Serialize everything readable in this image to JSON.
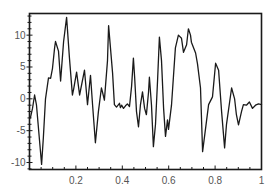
{
  "chart_data": {
    "type": "line",
    "title": "",
    "xlabel": "",
    "ylabel": "",
    "xlim": [
      0,
      1
    ],
    "ylim": [
      -11.1,
      13.4
    ],
    "grid": false,
    "legend": null,
    "x_ticks": [
      0.2,
      0.4,
      0.6,
      0.8,
      1
    ],
    "x_tick_labels": [
      "0.2",
      "0.4",
      "0.6",
      "0.8",
      "1"
    ],
    "y_ticks": [
      -10,
      -5,
      0,
      5,
      10
    ],
    "y_tick_labels": [
      "-10",
      "-5",
      "0",
      "5",
      "10"
    ],
    "line_color": "#1a1a1a",
    "series": [
      {
        "name": "signal",
        "x": [
          0.004,
          0.013,
          0.022,
          0.03,
          0.043,
          0.052,
          0.06,
          0.069,
          0.082,
          0.091,
          0.099,
          0.108,
          0.112,
          0.125,
          0.134,
          0.147,
          0.16,
          0.172,
          0.185,
          0.19,
          0.203,
          0.216,
          0.237,
          0.25,
          0.263,
          0.272,
          0.284,
          0.297,
          0.31,
          0.315,
          0.323,
          0.336,
          0.341,
          0.358,
          0.366,
          0.375,
          0.388,
          0.392,
          0.397,
          0.405,
          0.414,
          0.422,
          0.431,
          0.44,
          0.448,
          0.453,
          0.461,
          0.47,
          0.478,
          0.487,
          0.496,
          0.504,
          0.513,
          0.517,
          0.526,
          0.534,
          0.543,
          0.552,
          0.56,
          0.569,
          0.578,
          0.586,
          0.595,
          0.599,
          0.612,
          0.629,
          0.642,
          0.655,
          0.664,
          0.677,
          0.685,
          0.694,
          0.698,
          0.716,
          0.724,
          0.737,
          0.746,
          0.763,
          0.772,
          0.789,
          0.802,
          0.815,
          0.828,
          0.841,
          0.849,
          0.871,
          0.884,
          0.892,
          0.901,
          0.914,
          0.922,
          0.935,
          0.948,
          0.961,
          0.974,
          0.987,
          1.0
        ],
        "y": [
          -3.0,
          -1.5,
          0.6,
          -1.0,
          -6.5,
          -10.3,
          -6.0,
          0.0,
          3.3,
          3.2,
          4.8,
          8.0,
          9.0,
          7.5,
          2.8,
          9.0,
          12.8,
          6.5,
          0.6,
          1.5,
          4.2,
          0.6,
          4.5,
          -0.9,
          3.7,
          -1.0,
          -6.9,
          -2.0,
          1.7,
          1.0,
          -0.2,
          6.0,
          11.5,
          4.0,
          -0.9,
          -1.3,
          -0.7,
          -1.4,
          -1.0,
          -1.5,
          -1.1,
          -0.8,
          -1.2,
          2.0,
          6.4,
          3.5,
          -2.0,
          -4.4,
          -1.0,
          1.1,
          -1.5,
          -2.5,
          1.0,
          3.4,
          -1.0,
          -7.5,
          -4.0,
          3.0,
          9.7,
          6.0,
          -1.5,
          -5.9,
          -3.3,
          -4.8,
          -1.0,
          8.0,
          10.0,
          9.5,
          7.3,
          8.5,
          11.0,
          10.0,
          8.9,
          7.2,
          5.5,
          1.7,
          -8.3,
          -3.5,
          -0.9,
          0.3,
          5.6,
          4.5,
          -2.0,
          -7.7,
          -4.0,
          1.7,
          0.0,
          -2.5,
          -4.1,
          -2.0,
          -0.9,
          -1.0,
          -0.5,
          -1.5,
          -1.0,
          -0.8,
          -0.9
        ]
      }
    ]
  }
}
